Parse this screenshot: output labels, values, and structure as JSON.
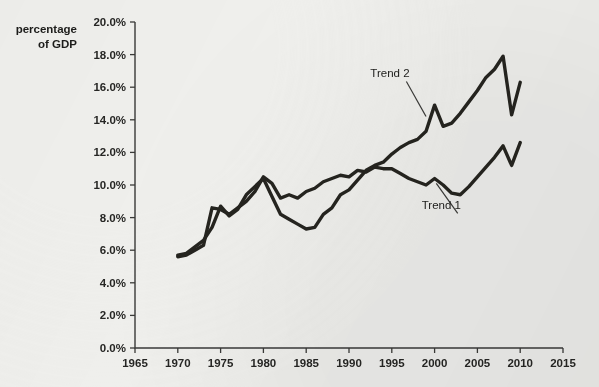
{
  "chart_data": {
    "type": "line",
    "title": "",
    "subtitle": "",
    "xlabel": "",
    "ylabel": "percentage of GDP",
    "ylabel_line1": "percentage",
    "ylabel_line2": "of GDP",
    "xlim": [
      1965,
      2015
    ],
    "ylim": [
      0,
      20
    ],
    "grid": false,
    "legend_position": "inline-annotations",
    "ytick_labels": [
      "0.0%",
      "2.0%",
      "4.0%",
      "6.0%",
      "8.0%",
      "10.0%",
      "12.0%",
      "14.0%",
      "16.0%",
      "18.0%",
      "20.0%"
    ],
    "ytick_values": [
      0,
      2,
      4,
      6,
      8,
      10,
      12,
      14,
      16,
      18,
      20
    ],
    "xtick_labels": [
      "1965",
      "1970",
      "1975",
      "1980",
      "1985",
      "1990",
      "1995",
      "2000",
      "2005",
      "2010",
      "2015"
    ],
    "xtick_values": [
      1965,
      1970,
      1975,
      1980,
      1985,
      1990,
      1995,
      2000,
      2005,
      2010,
      2015
    ],
    "line_color": "#25241f",
    "axis_color": "#3a3a38",
    "background_color": "#efefec",
    "annotations": [
      {
        "text": "Trend 2",
        "x": 1996.0,
        "y": 16.6,
        "target_x": 1999.0,
        "target_y": 14.2
      },
      {
        "text": "Trend 1",
        "x": 2002.0,
        "y": 8.5,
        "target_x": 2000.2,
        "target_y": 10.1
      }
    ],
    "series": [
      {
        "name": "Trend 1",
        "x": [
          1970,
          1971,
          1972,
          1973,
          1974,
          1975,
          1976,
          1977,
          1978,
          1979,
          1980,
          1981,
          1982,
          1983,
          1984,
          1985,
          1986,
          1987,
          1988,
          1989,
          1990,
          1991,
          1992,
          1993,
          1994,
          1995,
          1996,
          1997,
          1998,
          1999,
          2000,
          2001,
          2002,
          2003,
          2004,
          2005,
          2006,
          2007,
          2008,
          2009,
          2010
        ],
        "values": [
          5.6,
          5.7,
          6.0,
          6.3,
          8.6,
          8.5,
          8.2,
          8.6,
          9.0,
          9.6,
          10.5,
          10.1,
          9.2,
          9.4,
          9.2,
          9.6,
          9.8,
          10.2,
          10.4,
          10.6,
          10.5,
          10.9,
          10.8,
          11.1,
          11.0,
          11.0,
          10.7,
          10.4,
          10.2,
          10.0,
          10.4,
          10.0,
          9.5,
          9.4,
          9.9,
          10.5,
          11.1,
          11.7,
          12.4,
          11.2,
          12.6
        ]
      },
      {
        "name": "Trend 2",
        "x": [
          1970,
          1971,
          1972,
          1973,
          1974,
          1975,
          1976,
          1977,
          1978,
          1979,
          1980,
          1981,
          1982,
          1983,
          1984,
          1985,
          1986,
          1987,
          1988,
          1989,
          1990,
          1991,
          1992,
          1993,
          1994,
          1995,
          1996,
          1997,
          1998,
          1999,
          2000,
          2001,
          2002,
          2003,
          2004,
          2005,
          2006,
          2007,
          2008,
          2009,
          2010
        ],
        "values": [
          5.7,
          5.8,
          6.2,
          6.6,
          7.4,
          8.7,
          8.1,
          8.5,
          9.4,
          9.9,
          10.4,
          9.3,
          8.2,
          7.9,
          7.6,
          7.3,
          7.4,
          8.2,
          8.6,
          9.4,
          9.7,
          10.3,
          10.9,
          11.2,
          11.4,
          11.9,
          12.3,
          12.6,
          12.8,
          13.3,
          14.9,
          13.6,
          13.8,
          14.4,
          15.1,
          15.8,
          16.6,
          17.1,
          17.9,
          14.3,
          16.3
        ]
      }
    ]
  },
  "figure": {
    "frame_label": "chart-figure"
  }
}
